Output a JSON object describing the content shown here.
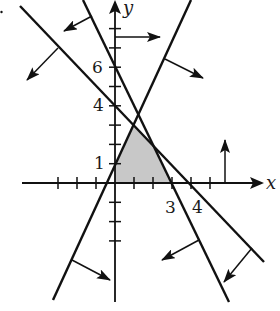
{
  "diagram": {
    "type": "linear-inequalities-feasible-region",
    "colors": {
      "ink": "#111111",
      "shade": "#c8c8c8",
      "background": "#ffffff"
    },
    "axes": {
      "x_label": "x",
      "y_label": "y",
      "origin_px": [
        115,
        183
      ],
      "unit_px": [
        19,
        19.3
      ],
      "x_ticks": [
        -3,
        -2,
        -1,
        1,
        2,
        3,
        4,
        5
      ],
      "y_ticks": [
        -1,
        -2,
        -3,
        1,
        2,
        3,
        4,
        5,
        6,
        7,
        8
      ],
      "x_tick_labels": [
        {
          "value": 3,
          "text": "3"
        },
        {
          "value": 4,
          "text": "4"
        }
      ],
      "y_tick_labels": [
        {
          "value": 1,
          "text": "1"
        },
        {
          "value": 4,
          "text": "4"
        },
        {
          "value": 6,
          "text": "6"
        }
      ]
    },
    "boundary_lines": [
      {
        "id": "line-a",
        "description": "positive slope, y-intercept 1",
        "p1": [
          53,
          300
        ],
        "p2": [
          191,
          0
        ],
        "arrow_from": [
          165,
          59
        ],
        "arrow_to": [
          203,
          78
        ],
        "arrow2_from": [
          72,
          260
        ],
        "arrow2_to": [
          110,
          280
        ]
      },
      {
        "id": "line-b",
        "description": "negative slope, y-intercept 6, x-intercept 3",
        "p1": [
          83,
          0
        ],
        "p2": [
          229,
          302
        ],
        "arrow_from": [
          92,
          16
        ],
        "arrow_to": [
          64,
          31
        ],
        "arrow2_from": [
          199,
          240
        ],
        "arrow2_to": [
          162,
          260
        ]
      },
      {
        "id": "line-c",
        "description": "negative slope, y-intercept 4, x-intercept 4",
        "p1": [
          20,
          6
        ],
        "p2": [
          264,
          262
        ],
        "arrow_from": [
          58,
          48
        ],
        "arrow_to": [
          27,
          80
        ],
        "arrow2_from": [
          252,
          248
        ],
        "arrow2_to": [
          224,
          282
        ]
      }
    ],
    "axis_constraints": [
      {
        "id": "x-nonneg",
        "description": "x >= 0 arrow off y-axis",
        "from": [
          115,
          37
        ],
        "to": [
          160,
          37
        ]
      },
      {
        "id": "y-nonneg",
        "description": "y >= 0 arrow off x-axis",
        "from": [
          225,
          183
        ],
        "to": [
          225,
          140
        ]
      }
    ],
    "feasible_region_px": [
      [
        115,
        183
      ],
      [
        115,
        163.7
      ],
      [
        133.5,
        125.1
      ],
      [
        153.7,
        146.2
      ],
      [
        171.5,
        183
      ]
    ]
  }
}
